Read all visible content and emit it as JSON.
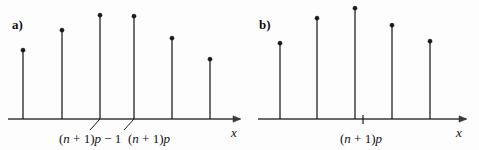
{
  "figure": {
    "width": 479,
    "height": 150,
    "background_color": "#fdfdfd",
    "ink_color": "#1a1a1a",
    "axis_color": "#3a3a3a"
  },
  "panels": [
    {
      "id": "a",
      "letter": "a)",
      "letter_x": 12,
      "letter_y": 18,
      "axis": {
        "x_start": 8,
        "x_end": 240,
        "y": 119,
        "arrow": true,
        "label": "x",
        "label_x": 231,
        "label_y": 126
      },
      "stems": [
        {
          "x": 23,
          "top_y": 49
        },
        {
          "x": 62,
          "top_y": 29
        },
        {
          "x": 100,
          "top_y": 14
        },
        {
          "x": 134,
          "top_y": 15
        },
        {
          "x": 172,
          "top_y": 37
        },
        {
          "x": 210,
          "top_y": 58
        }
      ],
      "leaders": [
        {
          "from_x": 100,
          "from_y": 119,
          "to_x": 90,
          "to_y": 130
        },
        {
          "from_x": 134,
          "from_y": 119,
          "to_x": 124,
          "to_y": 130
        }
      ],
      "labels": [
        {
          "name": "label-np-minus-1",
          "text": "(n + 1)p − 1",
          "x": 59,
          "y": 132,
          "parts": [
            {
              "t": "(",
              "italic": false
            },
            {
              "t": "n",
              "italic": true
            },
            {
              "t": " + 1)",
              "italic": false
            },
            {
              "t": "p",
              "italic": true
            },
            {
              "t": " − 1",
              "italic": false
            }
          ]
        },
        {
          "name": "label-np",
          "text": "(n + 1)p",
          "x": 128,
          "y": 132,
          "parts": [
            {
              "t": "(",
              "italic": false
            },
            {
              "t": "n",
              "italic": true
            },
            {
              "t": " + 1)",
              "italic": false
            },
            {
              "t": "p",
              "italic": true
            }
          ]
        }
      ],
      "ticks": []
    },
    {
      "id": "b",
      "letter": "b)",
      "letter_x": 259,
      "letter_y": 18,
      "axis": {
        "x_start": 258,
        "x_end": 466,
        "y": 119,
        "arrow": true,
        "label": "x",
        "label_x": 456,
        "label_y": 126
      },
      "stems": [
        {
          "x": 280,
          "top_y": 42
        },
        {
          "x": 317,
          "top_y": 17
        },
        {
          "x": 355,
          "top_y": 7
        },
        {
          "x": 392,
          "top_y": 24
        },
        {
          "x": 430,
          "top_y": 40
        }
      ],
      "leaders": [],
      "labels": [
        {
          "name": "label-np",
          "text": "(n + 1)p",
          "x": 340,
          "y": 132,
          "parts": [
            {
              "t": "(",
              "italic": false
            },
            {
              "t": "n",
              "italic": true
            },
            {
              "t": " + 1)",
              "italic": false
            },
            {
              "t": "p",
              "italic": true
            }
          ]
        }
      ],
      "ticks": [
        {
          "x": 363,
          "y_top": 115,
          "y_bottom": 124
        }
      ]
    }
  ],
  "chart_data": {
    "type": "bar",
    "title": "",
    "subtitle": "",
    "xlabel": "x",
    "ylabel": "",
    "grid": false,
    "legend_position": "none",
    "panels": [
      {
        "id": "a",
        "label": "a)",
        "categories": [
          "(n+1)p-3",
          "(n+1)p-2",
          "(n+1)p-1",
          "(n+1)p",
          "(n+1)p+1",
          "(n+1)p+2"
        ],
        "x": [
          23,
          62,
          100,
          134,
          172,
          210
        ],
        "values": [
          70,
          90,
          105,
          104,
          82,
          61
        ],
        "annotated_categories": [
          "(n + 1)p − 1",
          "(n + 1)p"
        ],
        "baseline_y": 119,
        "axis_range_x": [
          8,
          240
        ]
      },
      {
        "id": "b",
        "label": "b)",
        "categories": [
          "k-2",
          "k-1",
          "k",
          "k+1",
          "k+2"
        ],
        "x": [
          280,
          317,
          355,
          392,
          430
        ],
        "values": [
          77,
          102,
          112,
          95,
          79
        ],
        "annotated_categories": [
          "(n + 1)p"
        ],
        "tick_between": "(n + 1)p",
        "baseline_y": 119,
        "axis_range_x": [
          258,
          466
        ]
      }
    ]
  }
}
